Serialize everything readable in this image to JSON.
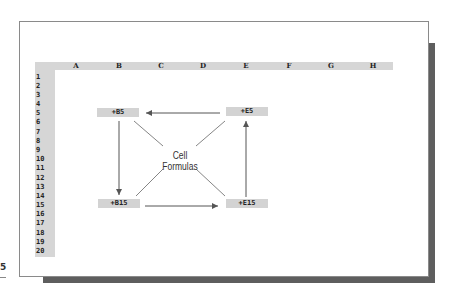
{
  "diagram": {
    "title": "Cell Formulas",
    "columns": [
      "A",
      "B",
      "C",
      "D",
      "E",
      "F",
      "G",
      "H"
    ],
    "rows": [
      "1",
      "2",
      "3",
      "4",
      "5",
      "6",
      "7",
      "8",
      "9",
      "10",
      "11",
      "12",
      "13",
      "14",
      "15",
      "16",
      "17",
      "18",
      "19",
      "20"
    ],
    "cells": [
      {
        "id": "B5",
        "formula": "+B5"
      },
      {
        "id": "E5",
        "formula": "+E5"
      },
      {
        "id": "B15",
        "formula": "+B15"
      },
      {
        "id": "E15",
        "formula": "+E15"
      }
    ],
    "arrows": [
      {
        "from": "E5",
        "to": "B5"
      },
      {
        "from": "B5",
        "to": "B15"
      },
      {
        "from": "B15",
        "to": "E15"
      },
      {
        "from": "E15",
        "to": "E5"
      }
    ],
    "colors": {
      "header_fill": "#d6d6d6",
      "cell_fill": "#d3d3d3",
      "shadow": "#5e5e5e",
      "arrow": "#555555"
    }
  },
  "margin_glyph": "5"
}
